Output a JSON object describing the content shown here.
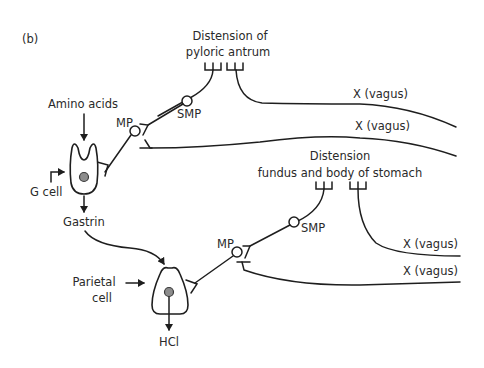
{
  "figure": {
    "panel_label": "(b)",
    "top_pathway": {
      "stimulus_line1": "Distension of",
      "stimulus_line2": "pyloric antrum",
      "ganglion_outer": "SMP",
      "ganglion_inner": "MP",
      "vagus_upper": "X (vagus)",
      "vagus_lower": "X (vagus)"
    },
    "g_cell": {
      "input": "Amino acids",
      "label": "G cell",
      "output": "Gastrin"
    },
    "bottom_pathway": {
      "stimulus_line1": "Distension",
      "stimulus_line2": "fundus and body of stomach",
      "ganglion_outer": "SMP",
      "ganglion_inner": "MP",
      "vagus_upper": "X (vagus)",
      "vagus_lower": "X (vagus)"
    },
    "parietal_cell": {
      "label_line1": "Parietal",
      "label_line2": "cell",
      "output": "HCl"
    }
  }
}
